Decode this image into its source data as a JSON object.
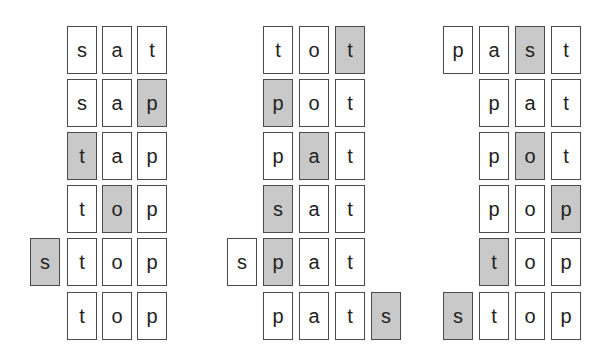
{
  "colors": {
    "shaded_fill": "#c9c9c9",
    "plain_fill": "#ffffff",
    "border": "#4a4a4a",
    "text": "#222222"
  },
  "groups": [
    {
      "name": "sat-to-stop",
      "rows": [
        {
          "word": "sat",
          "tiles": [
            {
              "letter": "s",
              "col": 1,
              "shaded": false
            },
            {
              "letter": "a",
              "col": 2,
              "shaded": false
            },
            {
              "letter": "t",
              "col": 3,
              "shaded": false
            }
          ]
        },
        {
          "word": "sap",
          "tiles": [
            {
              "letter": "s",
              "col": 1,
              "shaded": false
            },
            {
              "letter": "a",
              "col": 2,
              "shaded": false
            },
            {
              "letter": "p",
              "col": 3,
              "shaded": true
            }
          ]
        },
        {
          "word": "tap",
          "tiles": [
            {
              "letter": "t",
              "col": 1,
              "shaded": true
            },
            {
              "letter": "a",
              "col": 2,
              "shaded": false
            },
            {
              "letter": "p",
              "col": 3,
              "shaded": false
            }
          ]
        },
        {
          "word": "top",
          "tiles": [
            {
              "letter": "t",
              "col": 1,
              "shaded": false
            },
            {
              "letter": "o",
              "col": 2,
              "shaded": true
            },
            {
              "letter": "p",
              "col": 3,
              "shaded": false
            }
          ]
        },
        {
          "word": "stop",
          "tiles": [
            {
              "letter": "s",
              "col": 0,
              "shaded": true
            },
            {
              "letter": "t",
              "col": 1,
              "shaded": false
            },
            {
              "letter": "o",
              "col": 2,
              "shaded": false
            },
            {
              "letter": "p",
              "col": 3,
              "shaded": false
            }
          ]
        },
        {
          "word": "top",
          "tiles": [
            {
              "letter": "t",
              "col": 1,
              "shaded": false
            },
            {
              "letter": "o",
              "col": 2,
              "shaded": false
            },
            {
              "letter": "p",
              "col": 3,
              "shaded": false
            }
          ]
        }
      ]
    },
    {
      "name": "tot-to-pats",
      "rows": [
        {
          "word": "tot",
          "tiles": [
            {
              "letter": "t",
              "col": 1,
              "shaded": false
            },
            {
              "letter": "o",
              "col": 2,
              "shaded": false
            },
            {
              "letter": "t",
              "col": 3,
              "shaded": true
            }
          ]
        },
        {
          "word": "pot",
          "tiles": [
            {
              "letter": "p",
              "col": 1,
              "shaded": true
            },
            {
              "letter": "o",
              "col": 2,
              "shaded": false
            },
            {
              "letter": "t",
              "col": 3,
              "shaded": false
            }
          ]
        },
        {
          "word": "pat",
          "tiles": [
            {
              "letter": "p",
              "col": 1,
              "shaded": false
            },
            {
              "letter": "a",
              "col": 2,
              "shaded": true
            },
            {
              "letter": "t",
              "col": 3,
              "shaded": false
            }
          ]
        },
        {
          "word": "sat",
          "tiles": [
            {
              "letter": "s",
              "col": 1,
              "shaded": true
            },
            {
              "letter": "a",
              "col": 2,
              "shaded": false
            },
            {
              "letter": "t",
              "col": 3,
              "shaded": false
            }
          ]
        },
        {
          "word": "spat",
          "tiles": [
            {
              "letter": "s",
              "col": 0,
              "shaded": false
            },
            {
              "letter": "p",
              "col": 1,
              "shaded": true
            },
            {
              "letter": "a",
              "col": 2,
              "shaded": false
            },
            {
              "letter": "t",
              "col": 3,
              "shaded": false
            }
          ]
        },
        {
          "word": "pats",
          "tiles": [
            {
              "letter": "p",
              "col": 1,
              "shaded": false
            },
            {
              "letter": "a",
              "col": 2,
              "shaded": false
            },
            {
              "letter": "t",
              "col": 3,
              "shaded": false
            },
            {
              "letter": "s",
              "col": 4,
              "shaded": true
            }
          ]
        }
      ]
    },
    {
      "name": "past-to-stop",
      "rows": [
        {
          "word": "past",
          "tiles": [
            {
              "letter": "p",
              "col": 0,
              "shaded": false
            },
            {
              "letter": "a",
              "col": 1,
              "shaded": false
            },
            {
              "letter": "s",
              "col": 2,
              "shaded": true
            },
            {
              "letter": "t",
              "col": 3,
              "shaded": false
            }
          ]
        },
        {
          "word": "pat",
          "tiles": [
            {
              "letter": "p",
              "col": 1,
              "shaded": false
            },
            {
              "letter": "a",
              "col": 2,
              "shaded": false
            },
            {
              "letter": "t",
              "col": 3,
              "shaded": false
            }
          ]
        },
        {
          "word": "pot",
          "tiles": [
            {
              "letter": "p",
              "col": 1,
              "shaded": false
            },
            {
              "letter": "o",
              "col": 2,
              "shaded": true
            },
            {
              "letter": "t",
              "col": 3,
              "shaded": false
            }
          ]
        },
        {
          "word": "pop",
          "tiles": [
            {
              "letter": "p",
              "col": 1,
              "shaded": false
            },
            {
              "letter": "o",
              "col": 2,
              "shaded": false
            },
            {
              "letter": "p",
              "col": 3,
              "shaded": true
            }
          ]
        },
        {
          "word": "top",
          "tiles": [
            {
              "letter": "t",
              "col": 1,
              "shaded": true
            },
            {
              "letter": "o",
              "col": 2,
              "shaded": false
            },
            {
              "letter": "p",
              "col": 3,
              "shaded": false
            }
          ]
        },
        {
          "word": "stop",
          "tiles": [
            {
              "letter": "s",
              "col": 0,
              "shaded": true
            },
            {
              "letter": "t",
              "col": 1,
              "shaded": false
            },
            {
              "letter": "o",
              "col": 2,
              "shaded": false
            },
            {
              "letter": "p",
              "col": 3,
              "shaded": false
            }
          ]
        }
      ]
    }
  ]
}
